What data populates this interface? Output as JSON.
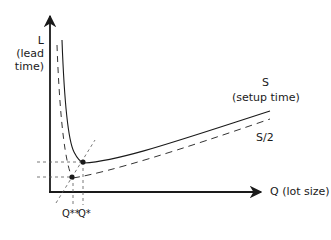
{
  "diagram": {
    "y_axis": {
      "symbol": "L",
      "label_line1": "(lead",
      "label_line2": "time)"
    },
    "x_axis": {
      "label": "Q (lot size)"
    },
    "curves": [
      {
        "name": "S",
        "label": "S",
        "sublabel": "(setup time)",
        "style": "solid"
      },
      {
        "name": "S/2",
        "label": "S/2",
        "style": "dashed"
      }
    ],
    "points": [
      {
        "name": "Q*",
        "label": "Q*"
      },
      {
        "name": "Q**",
        "label": "Q**"
      }
    ],
    "colors": {
      "line": "#1a1a1a",
      "dashed": "#333333",
      "background": "#ffffff"
    }
  }
}
